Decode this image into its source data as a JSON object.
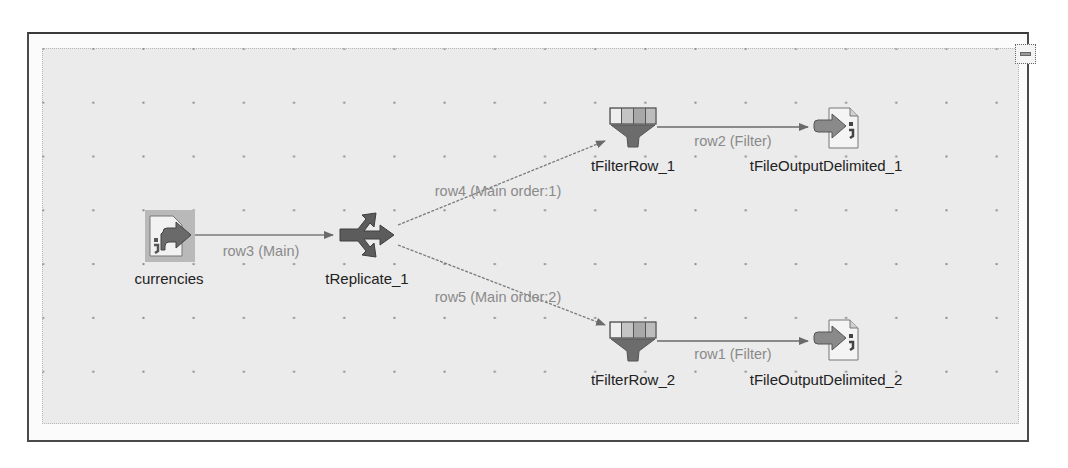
{
  "diagram": {
    "type": "talend-job-designer",
    "nodes": [
      {
        "id": "currencies",
        "label": "currencies",
        "component": "file-input-delimited",
        "icon": "file-input-icon"
      },
      {
        "id": "tReplicate_1",
        "label": "tReplicate_1",
        "component": "replicate",
        "icon": "replicate-icon"
      },
      {
        "id": "tFilterRow_1",
        "label": "tFilterRow_1",
        "component": "filter-row",
        "icon": "filter-icon"
      },
      {
        "id": "tFilterRow_2",
        "label": "tFilterRow_2",
        "component": "filter-row",
        "icon": "filter-icon"
      },
      {
        "id": "tFileOutputDelimited_1",
        "label": "tFileOutputDelimited_1",
        "component": "file-output-delimited",
        "icon": "file-output-icon"
      },
      {
        "id": "tFileOutputDelimited_2",
        "label": "tFileOutputDelimited_2",
        "component": "file-output-delimited",
        "icon": "file-output-icon"
      }
    ],
    "links": [
      {
        "id": "row3",
        "label": "row3 (Main)",
        "from": "currencies",
        "to": "tReplicate_1"
      },
      {
        "id": "row4",
        "label": "row4 (Main order:1)",
        "from": "tReplicate_1",
        "to": "tFilterRow_1"
      },
      {
        "id": "row5",
        "label": "row5 (Main order:2)",
        "from": "tReplicate_1",
        "to": "tFilterRow_2"
      },
      {
        "id": "row2",
        "label": "row2 (Filter)",
        "from": "tFilterRow_1",
        "to": "tFileOutputDelimited_1"
      },
      {
        "id": "row1",
        "label": "row1 (Filter)",
        "from": "tFilterRow_2",
        "to": "tFileOutputDelimited_2"
      }
    ]
  },
  "controls": {
    "minimize": {
      "icon": "minimize-icon"
    }
  },
  "colors": {
    "canvas_bg": "#ebebeb",
    "link_line": "#7a7a7a",
    "link_label": "#8a8a8a",
    "node_label": "#222222",
    "icon_dark": "#5a5a5a"
  }
}
